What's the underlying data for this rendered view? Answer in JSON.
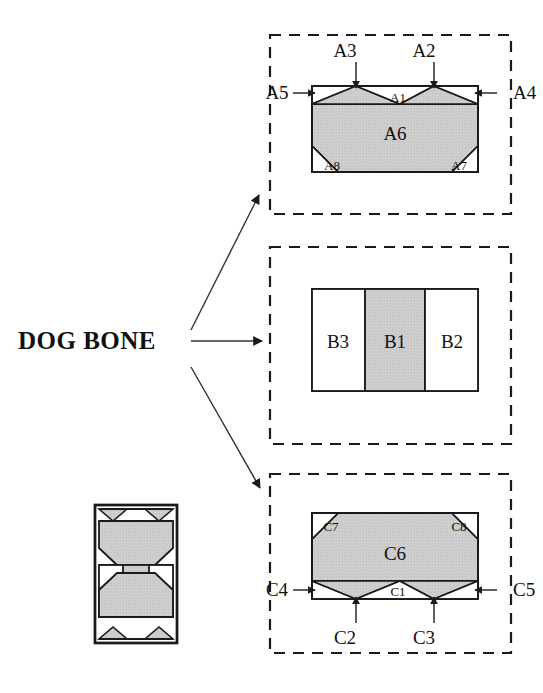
{
  "diagram": {
    "title_label": "DOG BONE",
    "colors": {
      "fill_gray": "#c9c9c9",
      "stroke": "#1a1a1a",
      "dashed_border": "#1a1a1a",
      "background": "#ffffff",
      "text": "#111111"
    },
    "thumbnail": {
      "name": "dog-bone-thumbnail",
      "description": "composite dog bone specimen"
    },
    "arrows": [
      {
        "name": "arrow-to-panel-a",
        "from": "DOG BONE",
        "to": "A"
      },
      {
        "name": "arrow-to-panel-b",
        "from": "DOG BONE",
        "to": "B"
      },
      {
        "name": "arrow-to-panel-c",
        "from": "DOG BONE",
        "to": "C"
      }
    ],
    "panels": [
      {
        "id": "A",
        "name": "panel-a",
        "labels": {
          "a1": "A1",
          "a2": "A2",
          "a3": "A3",
          "a4": "A4",
          "a5": "A5",
          "a6": "A6",
          "a7": "A7",
          "a8": "A8"
        }
      },
      {
        "id": "B",
        "name": "panel-b",
        "labels": {
          "b1": "B1",
          "b2": "B2",
          "b3": "B3"
        }
      },
      {
        "id": "C",
        "name": "panel-c",
        "labels": {
          "c1": "C1",
          "c2": "C2",
          "c3": "C3",
          "c4": "C4",
          "c5": "C5",
          "c6": "C6",
          "c7": "C7",
          "c8": "C8"
        }
      }
    ]
  }
}
